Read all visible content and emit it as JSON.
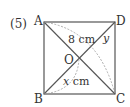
{
  "problem_number": "(5)",
  "vertices": {
    "A": "A",
    "B": "B",
    "C": "C",
    "D": "D",
    "O": "O"
  },
  "labels": {
    "diagonal_length": "8 cm",
    "segment_bo_var": "x",
    "segment_bo_unit": " cm",
    "angle_var": "y"
  },
  "colors": {
    "line": "#555555",
    "dashed": "#9a9a9a",
    "text": "#333333"
  }
}
